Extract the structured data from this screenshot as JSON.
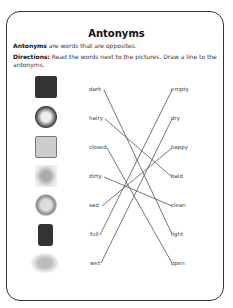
{
  "worksheet": {
    "title": "Antonyms",
    "definition_bold": "Antonyms",
    "definition_rest": " are words that are opposites.",
    "directions_bold": "Directions:",
    "directions_rest": " Read the words next to the pictures. Draw a line to the antonyms.",
    "left_words": [
      "dark",
      "hairy",
      "closed",
      "dirty",
      "sad",
      "full",
      "wet"
    ],
    "right_words": [
      "empty",
      "dry",
      "happy",
      "bald",
      "clean",
      "light",
      "open"
    ],
    "pictures": [
      "night-scene",
      "hairy-man",
      "closed-window",
      "dirty-cat",
      "sad-clown",
      "full-jar",
      "wet-dog"
    ],
    "matches": [
      {
        "left": "dark",
        "right": "light"
      },
      {
        "left": "hairy",
        "right": "bald"
      },
      {
        "left": "closed",
        "right": "open"
      },
      {
        "left": "dirty",
        "right": "clean"
      },
      {
        "left": "sad",
        "right": "happy"
      },
      {
        "left": "full",
        "right": "empty"
      },
      {
        "left": "wet",
        "right": "dry"
      }
    ]
  }
}
